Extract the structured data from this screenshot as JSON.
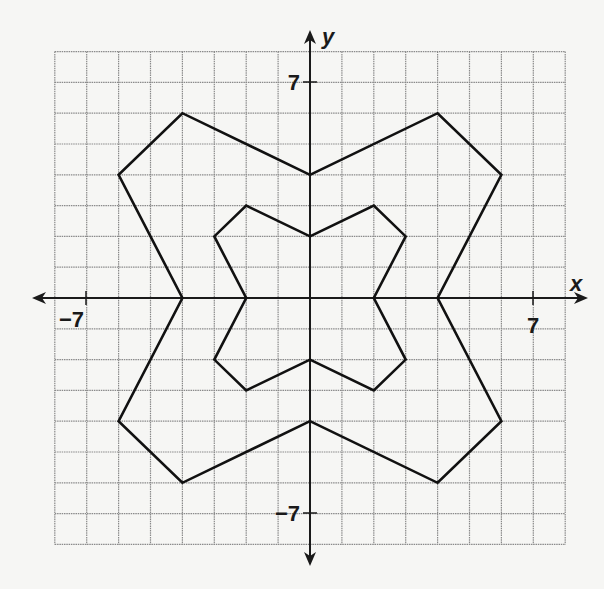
{
  "chart_data": {
    "type": "scatter",
    "title": "",
    "xlabel": "x",
    "ylabel": "y",
    "xlim": [
      -8,
      8
    ],
    "ylim": [
      -8,
      8
    ],
    "grid": true,
    "x_tick_labels": [
      {
        "value": -7,
        "label": "−7"
      },
      {
        "value": 7,
        "label": "7"
      }
    ],
    "y_tick_labels": [
      {
        "value": 7,
        "label": "7"
      },
      {
        "value": -7,
        "label": "−7"
      }
    ],
    "series": [
      {
        "name": "outer-figure",
        "closed": true,
        "points": [
          [
            0,
            4
          ],
          [
            4,
            6
          ],
          [
            6,
            4
          ],
          [
            4,
            0
          ],
          [
            6,
            -4
          ],
          [
            4,
            -6
          ],
          [
            0,
            -4
          ],
          [
            -4,
            -6
          ],
          [
            -6,
            -4
          ],
          [
            -4,
            0
          ],
          [
            -6,
            4
          ],
          [
            -4,
            6
          ]
        ]
      },
      {
        "name": "inner-figure",
        "closed": true,
        "points": [
          [
            0,
            2
          ],
          [
            2,
            3
          ],
          [
            3,
            2
          ],
          [
            2,
            0
          ],
          [
            3,
            -2
          ],
          [
            2,
            -3
          ],
          [
            0,
            -2
          ],
          [
            -2,
            -3
          ],
          [
            -3,
            -2
          ],
          [
            -2,
            0
          ],
          [
            -3,
            2
          ],
          [
            -2,
            3
          ]
        ]
      }
    ]
  },
  "labels": {
    "x_axis": "x",
    "y_axis": "y",
    "x_neg_tick": "−7",
    "x_pos_tick": "7",
    "y_pos_tick": "7",
    "y_neg_tick": "−7"
  },
  "colors": {
    "background": "#f6f6f4",
    "grid": "#8a8a8a",
    "ink": "#111111"
  }
}
